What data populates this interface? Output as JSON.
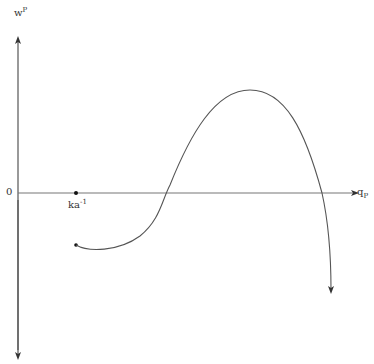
{
  "diagram": {
    "y_axis_label": "w",
    "y_axis_label_sup": "P",
    "x_axis_label": "q",
    "x_axis_label_sub": "P",
    "origin_label": "0",
    "marker_label": "ka",
    "marker_label_sup": "-1",
    "colors": {
      "line": "#444444",
      "axis": "#555555",
      "background": "#ffffff"
    }
  }
}
